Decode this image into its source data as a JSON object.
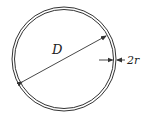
{
  "diagram": {
    "labels": {
      "diameter": "D",
      "thickness": "2r"
    },
    "colors": {
      "stroke": "#333333",
      "background": "#ffffff"
    }
  }
}
